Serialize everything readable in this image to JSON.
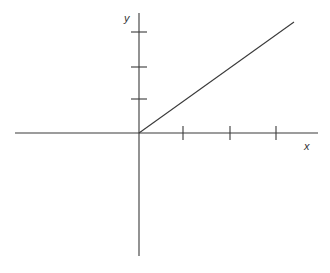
{
  "figure": {
    "type": "coordinate-plane-line-graph",
    "width": 330,
    "height": 273,
    "background_color": "#ffffff",
    "stroke_color": "#3a3a3a",
    "axis_stroke_width": 1.1,
    "line_stroke_width": 1.1
  },
  "axes": {
    "x_axis": {
      "label": "x",
      "label_position": {
        "x": 304,
        "y": 141
      },
      "y_pixel": 133,
      "x_start_pixel": 15,
      "x_end_pixel": 318,
      "tick_pixels": [
        183,
        230,
        276
      ],
      "tick_half_length": 7,
      "tick_labels": [
        "",
        "",
        ""
      ]
    },
    "y_axis": {
      "label": "y",
      "label_position": {
        "x": 124,
        "y": 13
      },
      "x_pixel": 139,
      "y_start_pixel": 13,
      "y_end_pixel": 256,
      "tick_pixels": [
        32,
        67,
        99
      ],
      "tick_half_length": 8,
      "tick_labels": [
        "",
        "",
        ""
      ]
    },
    "origin": {
      "x": 139,
      "y": 133
    }
  },
  "chart_data": {
    "type": "line",
    "title": "",
    "subtitle": "",
    "xlabel": "x",
    "ylabel": "y",
    "grid": false,
    "legend": null,
    "axis_style": "cartesian-cross",
    "xlim": [
      -2.66,
      3.85
    ],
    "ylim": [
      -3.72,
      3.65
    ],
    "x_tick_values": [
      1,
      2,
      3
    ],
    "y_tick_values": [
      1,
      2,
      3
    ],
    "x_tick_labels": [
      "",
      "",
      ""
    ],
    "y_tick_labels": [
      "",
      "",
      ""
    ],
    "series": [
      {
        "name": "line",
        "description": "straight ray from the origin rising to the right",
        "equation": "y = 0.72x",
        "slope": 0.72,
        "intercept": 0,
        "x": [
          0,
          3.33
        ],
        "y": [
          0,
          2.4
        ],
        "pixel_points": [
          {
            "x": 139,
            "y": 133
          },
          {
            "x": 294,
            "y": 22
          }
        ],
        "color": "#3a3a3a"
      }
    ],
    "annotations": []
  }
}
